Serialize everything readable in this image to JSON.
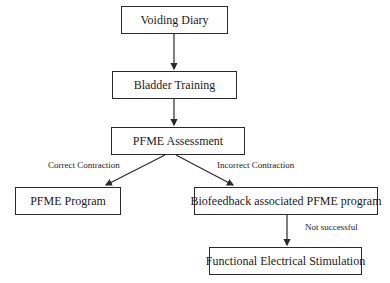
{
  "nodes": {
    "voiding_diary": "Voiding Diary",
    "bladder_training": "Bladder Training",
    "pfme_assessment": "PFME Assessment",
    "pfme_program": "PFME Program",
    "biofeedback": "Biofeedback associated PFME program",
    "fes": "Functional Electrical Stimulation"
  },
  "edge_labels": {
    "correct": "Correct Contraction",
    "incorrect": "Incorrect Contraction",
    "not_successful": "Not successful"
  },
  "colors": {
    "stroke": "#2a2a2a",
    "background": "#ffffff"
  }
}
